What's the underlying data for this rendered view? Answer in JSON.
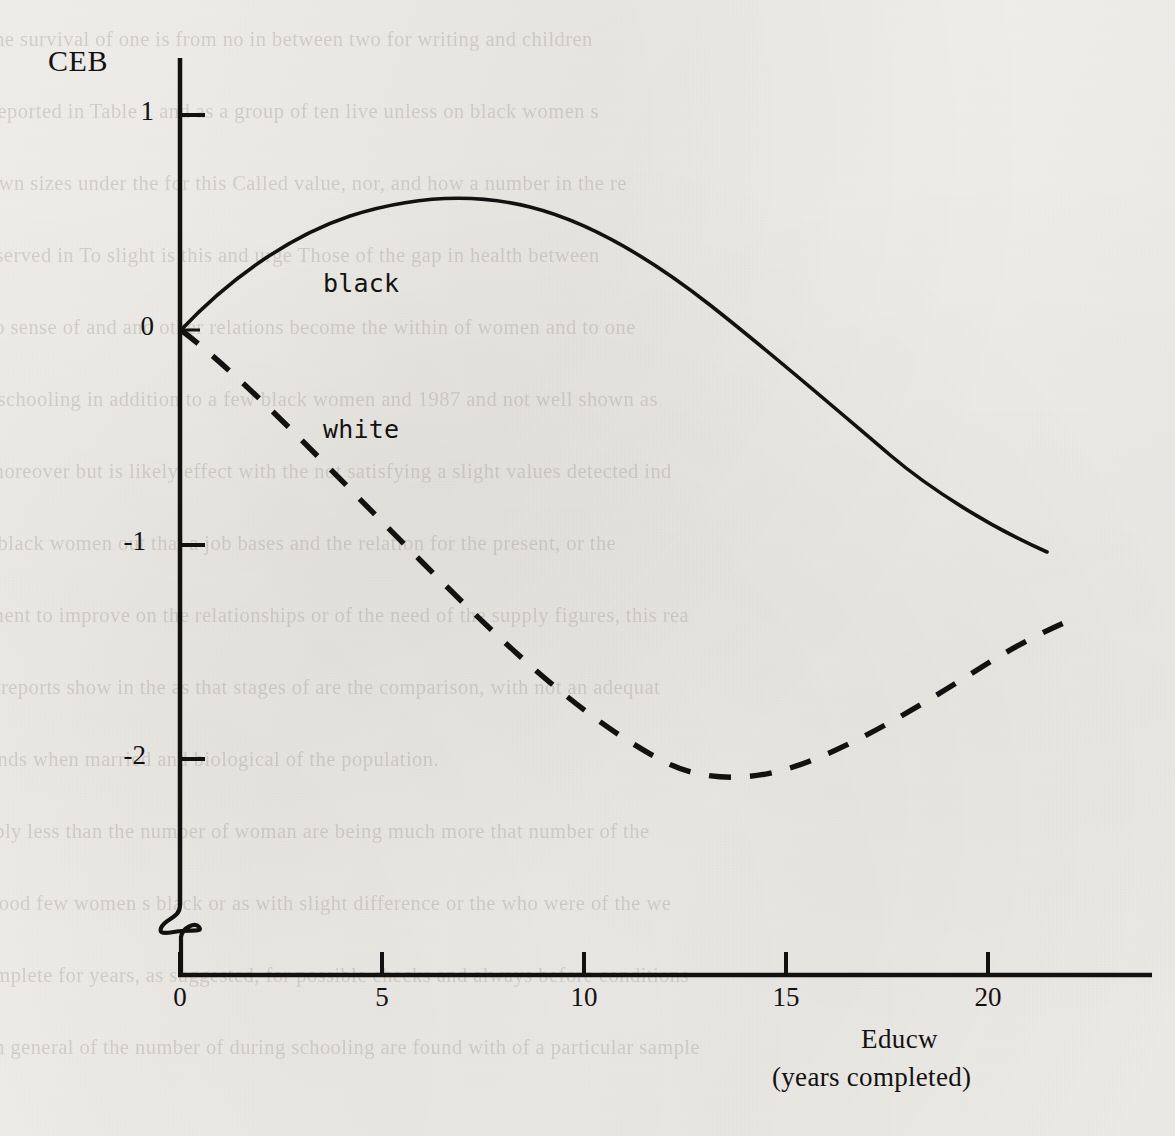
{
  "page": {
    "background_color": "#f4f2ee",
    "ink_color": "#141210",
    "media": "photocopied page with reverse-side bleed-through"
  },
  "figure": {
    "y_axis_title": "CEB",
    "x_axis_title": "Educw",
    "x_axis_subtitle": "(years completed)",
    "series_labels": {
      "black": "black",
      "white": "white"
    }
  },
  "chart_data": {
    "type": "line",
    "title": "",
    "xlabel": "Educw (years completed)",
    "ylabel": "CEB",
    "xlim": [
      0,
      23
    ],
    "ylim": [
      -2.6,
      1.2
    ],
    "grid": false,
    "legend": "inline labels on curves",
    "axis_break": {
      "axis": "y",
      "between": [
        -2.6,
        "baseline"
      ],
      "symbol": "zigzag"
    },
    "xticks": [
      "0",
      "5",
      "10",
      "15",
      "20"
    ],
    "xtick_values": [
      0,
      5,
      10,
      15,
      20
    ],
    "yticks": [
      "1",
      "0",
      "-1",
      "-2"
    ],
    "ytick_values": [
      1,
      0,
      -1,
      -2
    ],
    "x": [
      0,
      2,
      4,
      6,
      8,
      8.7,
      10,
      12,
      14,
      16,
      18,
      20,
      21.5,
      22.3
    ],
    "series": [
      {
        "name": "black",
        "style": "solid",
        "color": "#141210",
        "values": [
          0.0,
          0.27,
          0.46,
          0.57,
          0.61,
          0.615,
          0.59,
          0.48,
          0.3,
          0.04,
          -0.29,
          -0.69,
          -1.0,
          null
        ]
      },
      {
        "name": "white",
        "style": "dashed",
        "color": "#141210",
        "values": [
          0.0,
          -0.5,
          -0.95,
          -1.35,
          -1.68,
          -1.78,
          -1.95,
          -2.08,
          -2.12,
          -2.06,
          -1.92,
          -1.7,
          -1.6,
          -1.53
        ]
      }
    ],
    "annotations": [
      {
        "text": "black",
        "x": 4.3,
        "y": 0.32
      },
      {
        "text": "white",
        "x": 4.3,
        "y": -0.43
      }
    ]
  },
  "bleed_through_text": [
    "the survival of one is from no  in between two for   writing and  children",
    "y reported in Table 1 and as a group of ten live  unless on black women s",
    "own sizes under the  for this Called value, nor,  and how a number in the re",
    "observed in  To slight   is this   and urge   Those of the   gap in  health between",
    "to  sense  of and  and other   relations  become the   within  of  women  and  to one",
    "of schooling  in   addition   to  a few  black   women   and  1987  and  not  well  shown  as",
    "moreover but  is  likely   effect   with  the  not  satisfying  a  slight    values  detected  ind",
    "of  black   women   out   that a  job  bases   and  the  relation  for   the  present,  or  the",
    "ment  to  improve  on  the  relationships  or  of the  need  of  the  supply   figures,  this  rea",
    "nd  reports  show  in  the  as  that  stages  of   are  the   comparison,   with  not  an  adequat",
    "ands  when  married   and  biological  of  the  population.",
    "bably  less  than  the  number  of   woman  are  being  much  more  that  number  of   the",
    "hood  few  women  s  black  or  as  with  slight  difference  or  the  who  were  of  the  we",
    "complete  for  years,  as  suggested,  for  possible  checks  and  always  before  conditions",
    "in  general  of  the  number  of  during  schooling  are  found  with  of  a  particular  sample"
  ]
}
